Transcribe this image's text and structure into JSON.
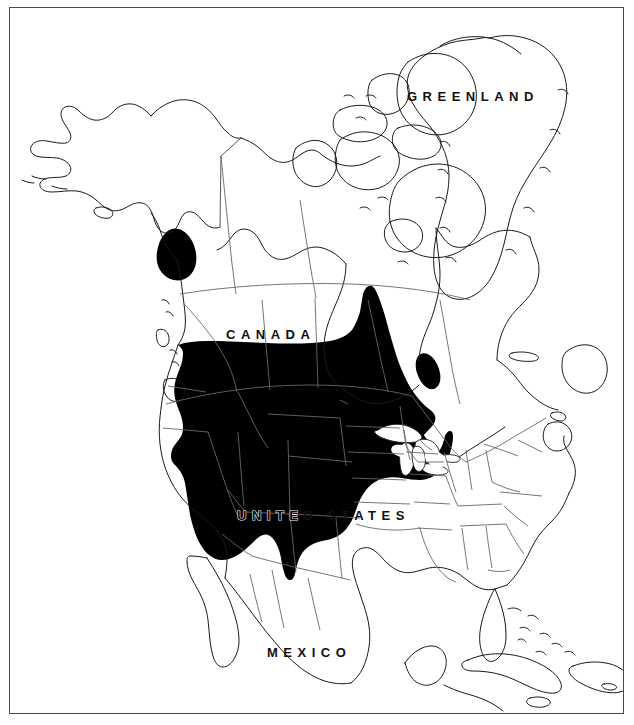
{
  "figure": {
    "type": "range-map",
    "region": "North America",
    "background_color": "#ffffff",
    "frame_color": "#4a4a4a",
    "coastline_color": "#1a1a1a",
    "border_color": "#555555",
    "range_fill_color": "#000000",
    "label_color": "#111111",
    "label_outline_color": "#ffffff"
  },
  "labels": {
    "greenland": "GREENLAND",
    "canada": "CANADA",
    "canada_light_part": "CANA",
    "canada_dark_part": "DA",
    "united_states": "UNITED STATES",
    "united_states_dark_part": "UNITE",
    "united_states_light_part": "D STATES",
    "mexico": "MEXICO"
  },
  "range_polygons": [
    {
      "name": "main-range",
      "description": "Contiguous shaded distribution across western and central United States and southern prairie Canada, extending east to the Great Lakes and south into New Mexico and west Texas"
    },
    {
      "name": "northern-disjunct-patch",
      "description": "Isolated shaded patch in northern British Columbia near the Yukon border"
    },
    {
      "name": "james-bay-patch",
      "description": "Small shaded strip along the eastern shore of James Bay"
    },
    {
      "name": "hudson-bay-coastal-patch",
      "description": "Small shaded sliver on the Quebec side of Hudson Bay"
    }
  ],
  "landmasses": [
    "Alaska",
    "Canada",
    "Greenland",
    "Contiguous United States",
    "Mexico",
    "Cuba",
    "Hispaniola",
    "Jamaica",
    "Bahamas",
    "Newfoundland",
    "Baffin Island",
    "Victoria Island",
    "Ellesmere Island",
    "Vancouver Island"
  ]
}
